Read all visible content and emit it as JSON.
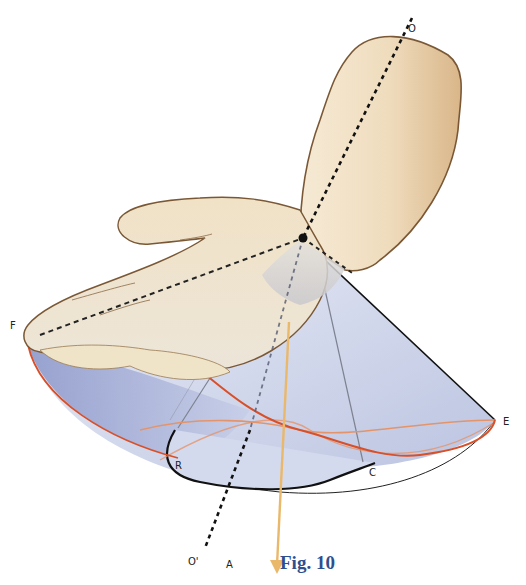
{
  "figure": {
    "caption": "Fig. 10",
    "colors": {
      "skin_light": "#f4e6cf",
      "skin_mid": "#e8cfa8",
      "skin_dark": "#d2ab79",
      "skin_outline": "#7a5836",
      "cone_fill_light": "#e3e8f4",
      "cone_fill_mid": "#c3cbe4",
      "cone_fill_dark": "#98a3cc",
      "base_rim": "#d8502a",
      "inner_ellipse": "#e4946a",
      "axis_arrow": "#eab86a",
      "caption_blue": "#2e4f8f",
      "line_dark": "#111111",
      "line_grey": "#7e8290"
    }
  },
  "labels": {
    "O": "O",
    "O_prime": "O'",
    "F": "F",
    "E": "E",
    "R": "R",
    "C": "C",
    "A": "A"
  }
}
